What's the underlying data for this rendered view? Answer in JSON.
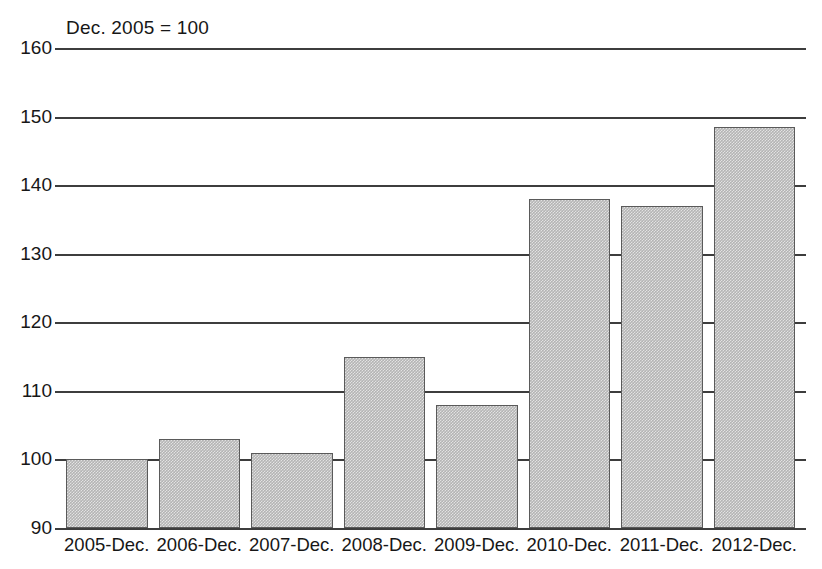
{
  "chart_data": {
    "type": "bar",
    "title": "Dec. 2005 = 100",
    "xlabel": "",
    "ylabel": "",
    "categories": [
      "2005-Dec.",
      "2006-Dec.",
      "2007-Dec.",
      "2008-Dec.",
      "2009-Dec.",
      "2010-Dec.",
      "2011-Dec.",
      "2012-Dec."
    ],
    "values": [
      100,
      103,
      101,
      115,
      108,
      138,
      137,
      148.5
    ],
    "ylim": [
      90,
      160
    ],
    "ytick_labels": [
      "160",
      "150",
      "140",
      "130",
      "120",
      "110",
      "100",
      "90"
    ],
    "ytick_values": [
      160,
      150,
      140,
      130,
      120,
      110,
      100,
      90
    ],
    "ystep": 10,
    "grid": true,
    "legend": "none",
    "bar_fill_color": "#b4b4b4",
    "bar_edge_color": "#5a5a5a",
    "axis_color": "#3d3d3d",
    "background_color": "#ffffff"
  }
}
